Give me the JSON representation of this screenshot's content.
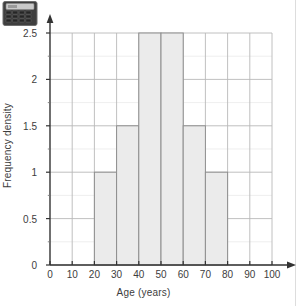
{
  "page": {
    "background_color": "#ffffff",
    "margin_rule_color": "#dddddd",
    "calculator_icon": "calculator-icon"
  },
  "chart_data": {
    "type": "bar",
    "title": "",
    "subtitle": "",
    "xlabel": "Age (years)",
    "ylabel": "Frequency density",
    "xlim": [
      0,
      100
    ],
    "ylim": [
      0,
      2.5
    ],
    "xticks": [
      0,
      10,
      20,
      30,
      40,
      50,
      60,
      70,
      80,
      90,
      100
    ],
    "xtick_labels": [
      "0",
      "10",
      "20",
      "30",
      "40",
      "50",
      "60",
      "70",
      "80",
      "90",
      "100"
    ],
    "yticks": [
      0,
      0.5,
      1,
      1.5,
      2,
      2.5
    ],
    "ytick_labels": [
      "0",
      "0.5",
      "1",
      "1.5",
      "2",
      "2.5"
    ],
    "y_minor_step": 0.25,
    "x_minor_step": 10,
    "grid": true,
    "legend": null,
    "annotations": [],
    "bar_fill_color": "#ebebeb",
    "bar_border_color": "#8e8e8e",
    "grid_major_color": "#b9b9b9",
    "grid_minor_color": "#e2e2e2",
    "axis_color": "#333333",
    "bins": [
      {
        "label": "0-20",
        "x0": 0,
        "x1": 20,
        "value": 0
      },
      {
        "label": "20-30",
        "x0": 20,
        "x1": 30,
        "value": 1
      },
      {
        "label": "30-40",
        "x0": 30,
        "x1": 40,
        "value": 1.5
      },
      {
        "label": "40-50",
        "x0": 40,
        "x1": 50,
        "value": 2.5
      },
      {
        "label": "50-60",
        "x0": 50,
        "x1": 60,
        "value": 2.5
      },
      {
        "label": "60-70",
        "x0": 60,
        "x1": 70,
        "value": 1.5
      },
      {
        "label": "70-80",
        "x0": 70,
        "x1": 80,
        "value": 1
      },
      {
        "label": "80-100",
        "x0": 80,
        "x1": 100,
        "value": 0
      }
    ]
  }
}
